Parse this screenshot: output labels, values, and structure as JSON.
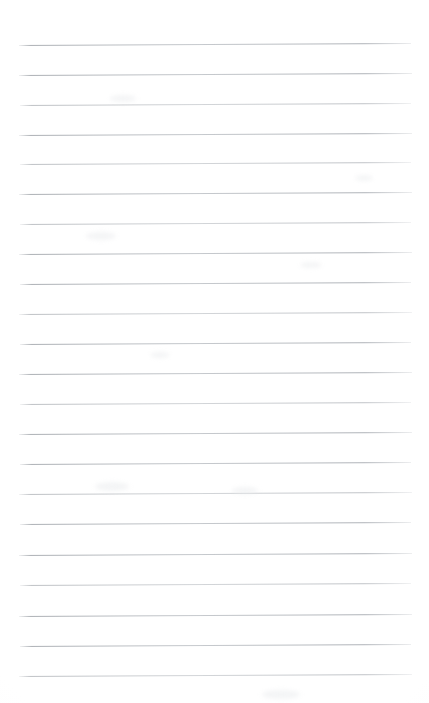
{
  "page": {
    "kind": "blank-ruled-notebook-page",
    "width": 429,
    "height": 703,
    "background_color": "#ffffff",
    "content_text": "",
    "top_margin_px": 45,
    "bottom_margin_px": 28,
    "left_margin_px": 18,
    "right_margin_px": 17
  },
  "ruling": {
    "line_color": "#b0b4b9",
    "line_color_light": "#c8cbcf",
    "line_thickness_px": 1,
    "line_spacing_px": 30,
    "line_count": 21,
    "line_start_x": 18,
    "line_end_x": 412,
    "scan_tilt_deg": -0.3,
    "lines": [
      {
        "index": 1,
        "y": 45,
        "x_start": 19,
        "x_end": 411,
        "weight": "strong"
      },
      {
        "index": 2,
        "y": 75,
        "x_start": 19,
        "x_end": 412,
        "weight": "strong"
      },
      {
        "index": 3,
        "y": 105,
        "x_start": 20,
        "x_end": 411,
        "weight": "faint"
      },
      {
        "index": 4,
        "y": 135,
        "x_start": 19,
        "x_end": 412,
        "weight": "strong"
      },
      {
        "index": 5,
        "y": 164,
        "x_start": 20,
        "x_end": 411,
        "weight": "faint"
      },
      {
        "index": 6,
        "y": 194,
        "x_start": 19,
        "x_end": 412,
        "weight": "strong"
      },
      {
        "index": 7,
        "y": 224,
        "x_start": 20,
        "x_end": 411,
        "weight": "faint"
      },
      {
        "index": 8,
        "y": 254,
        "x_start": 19,
        "x_end": 412,
        "weight": "strong"
      },
      {
        "index": 9,
        "y": 284,
        "x_start": 20,
        "x_end": 411,
        "weight": "strong"
      },
      {
        "index": 10,
        "y": 314,
        "x_start": 19,
        "x_end": 412,
        "weight": "faint"
      },
      {
        "index": 11,
        "y": 344,
        "x_start": 20,
        "x_end": 411,
        "weight": "strong"
      },
      {
        "index": 12,
        "y": 374,
        "x_start": 19,
        "x_end": 412,
        "weight": "strong"
      },
      {
        "index": 13,
        "y": 404,
        "x_start": 20,
        "x_end": 411,
        "weight": "faint"
      },
      {
        "index": 14,
        "y": 434,
        "x_start": 19,
        "x_end": 412,
        "weight": "strong"
      },
      {
        "index": 15,
        "y": 464,
        "x_start": 20,
        "x_end": 411,
        "weight": "strong"
      },
      {
        "index": 16,
        "y": 494,
        "x_start": 19,
        "x_end": 412,
        "weight": "faint"
      },
      {
        "index": 17,
        "y": 524,
        "x_start": 20,
        "x_end": 411,
        "weight": "strong"
      },
      {
        "index": 18,
        "y": 555,
        "x_start": 19,
        "x_end": 412,
        "weight": "strong"
      },
      {
        "index": 19,
        "y": 585,
        "x_start": 20,
        "x_end": 411,
        "weight": "faint"
      },
      {
        "index": 20,
        "y": 616,
        "x_start": 19,
        "x_end": 412,
        "weight": "strong"
      },
      {
        "index": 21,
        "y": 646,
        "x_start": 20,
        "x_end": 411,
        "weight": "strong"
      },
      {
        "index": 22,
        "y": 676,
        "x_start": 19,
        "x_end": 412,
        "weight": "faint"
      }
    ]
  },
  "smudges": [
    {
      "x": 110,
      "y": 95,
      "w": 26,
      "h": 7
    },
    {
      "x": 355,
      "y": 175,
      "w": 18,
      "h": 6
    },
    {
      "x": 86,
      "y": 232,
      "w": 30,
      "h": 8
    },
    {
      "x": 300,
      "y": 262,
      "w": 22,
      "h": 6
    },
    {
      "x": 150,
      "y": 352,
      "w": 20,
      "h": 6
    },
    {
      "x": 95,
      "y": 482,
      "w": 34,
      "h": 9
    },
    {
      "x": 232,
      "y": 487,
      "w": 26,
      "h": 7
    },
    {
      "x": 262,
      "y": 690,
      "w": 38,
      "h": 9
    }
  ]
}
